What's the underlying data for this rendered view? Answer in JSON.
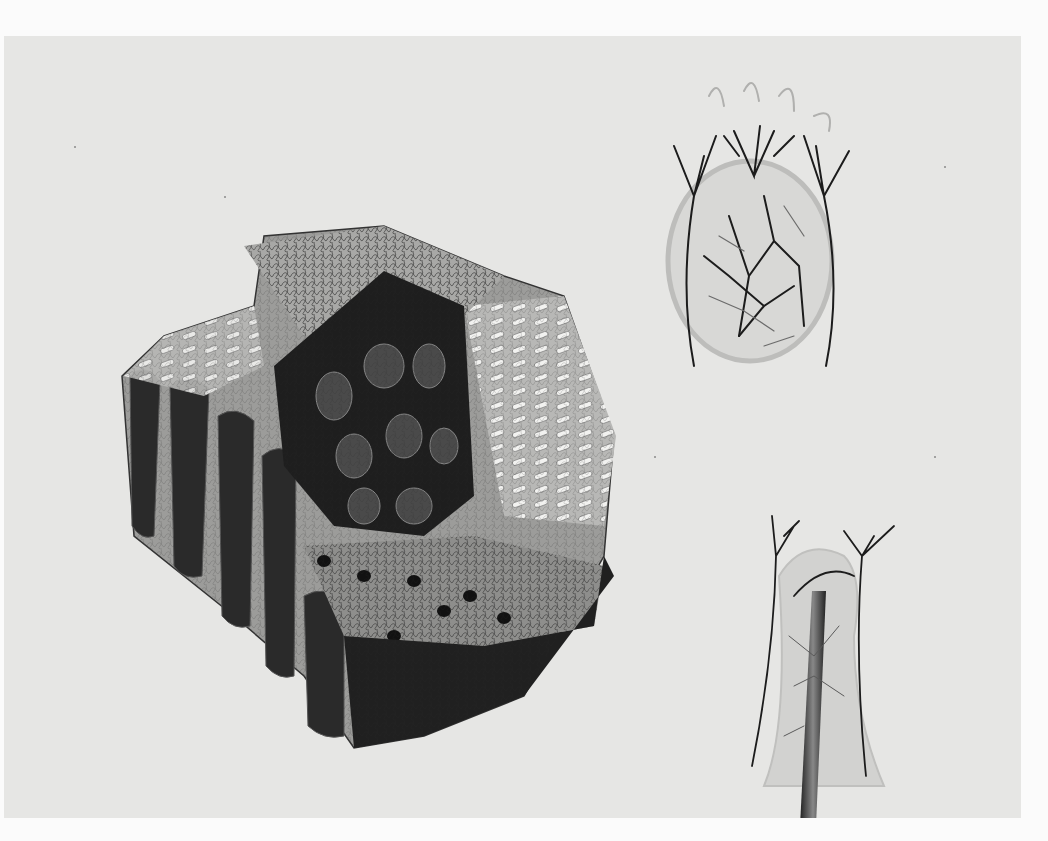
{
  "image": {
    "kind": "anatomical illustration plate",
    "palette": {
      "margin": "#fbfbfb",
      "paper": "#e6e6e4",
      "ink_dark": "#1a1a1a",
      "ink_mid": "#4a4a4a",
      "tissue_light": "#d4d4d2",
      "villi_light": "#f1f1ef"
    },
    "figures": [
      {
        "id": "fig-main",
        "depicts": "block of intestinal mucosa with villi and crypt openings",
        "position": "left-center"
      },
      {
        "id": "fig-top-right",
        "depicts": "single villus / follicle with branching blood vessel network",
        "position": "top-right"
      },
      {
        "id": "fig-bottom-right",
        "depicts": "villus with central lacteal tube and surrounding vessels",
        "position": "bottom-right"
      }
    ]
  }
}
